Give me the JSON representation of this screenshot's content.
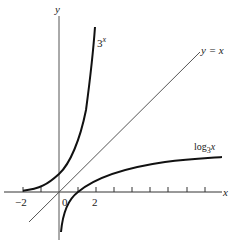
{
  "diagram": {
    "axes": {
      "x_label": "x",
      "y_label": "y"
    },
    "ticks": {
      "neg2": "−2",
      "zero": "0",
      "two": "2"
    },
    "curves": {
      "exp": {
        "base": "3",
        "exp": "x"
      },
      "identity": "y = x",
      "log": {
        "prefix": "log",
        "base": "3",
        "arg": "x"
      }
    }
  }
}
